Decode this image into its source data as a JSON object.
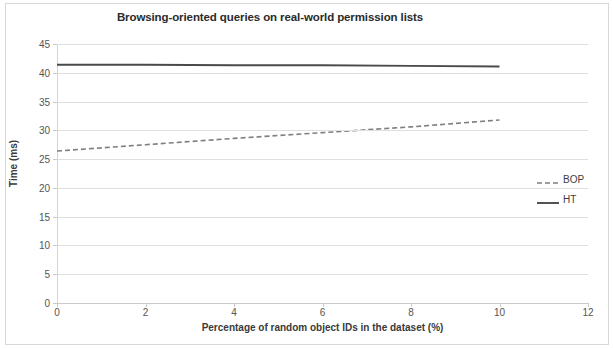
{
  "chart_data": {
    "type": "line",
    "title": "Browsing-oriented queries on real-world permission lists",
    "xlabel": "Percentage of random object IDs in the dataset (%)",
    "ylabel": "Time (ms)",
    "xlim": [
      0,
      12
    ],
    "ylim": [
      0,
      45
    ],
    "xticks": [
      0,
      2,
      4,
      6,
      8,
      10,
      12
    ],
    "yticks": [
      0,
      5,
      10,
      15,
      20,
      25,
      30,
      35,
      40,
      45
    ],
    "grid": "horizontal",
    "legend_position": "right",
    "series": [
      {
        "name": "BOP",
        "style": "dashed",
        "color": "#7f7f7f",
        "x": [
          0,
          2,
          4,
          6,
          8,
          10
        ],
        "values": [
          26.4,
          27.5,
          28.6,
          29.6,
          30.6,
          31.8
        ]
      },
      {
        "name": "HT",
        "style": "solid",
        "color": "#4a4a4a",
        "x": [
          0,
          2,
          4,
          6,
          8,
          10
        ],
        "values": [
          41.4,
          41.4,
          41.3,
          41.3,
          41.2,
          41.1
        ]
      }
    ]
  },
  "legend": {
    "items": [
      {
        "label": "BOP"
      },
      {
        "label": "HT"
      }
    ]
  }
}
